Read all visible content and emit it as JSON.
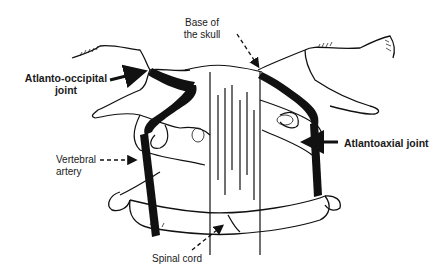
{
  "diagram": {
    "type": "anatomical-illustration",
    "labels": {
      "base_of_skull_line1": "Base of",
      "base_of_skull_line2": "the skull",
      "atlanto_occipital_line1": "Atlanto-occipital",
      "atlanto_occipital_line2": "joint",
      "atlantoaxial": "Atlantoaxial joint",
      "vertebral_artery_line1": "Vertebral",
      "vertebral_artery_line2": "artery",
      "spinal_cord": "Spinal cord"
    },
    "arrows": [
      {
        "label": "Base of the skull",
        "style": "dashed"
      },
      {
        "label": "Atlanto-occipital joint",
        "style": "solid"
      },
      {
        "label": "Atlantoaxial joint",
        "style": "solid"
      },
      {
        "label": "Vertebral artery",
        "style": "dashed"
      },
      {
        "label": "Spinal cord",
        "style": "dashed"
      }
    ],
    "colors": {
      "ink": "#111111",
      "background": "#ffffff"
    }
  }
}
